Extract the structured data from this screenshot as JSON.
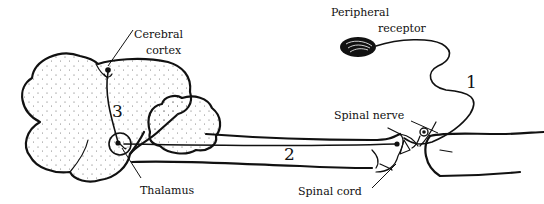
{
  "figure": {
    "labels": {
      "cerebral_cortex_line1": "Cerebral",
      "cerebral_cortex_line2": "cortex",
      "peripheral_receptor_line1": "Peripheral",
      "peripheral_receptor_line2": "receptor",
      "spinal_nerve": "Spinal nerve",
      "spinal_cord": "Spinal cord",
      "thalamus": "Thalamus"
    },
    "neuron_numbers": {
      "first_order": "1",
      "second_order": "2",
      "third_order": "3"
    },
    "colors": {
      "ink": "#111111",
      "background": "#ffffff"
    }
  }
}
